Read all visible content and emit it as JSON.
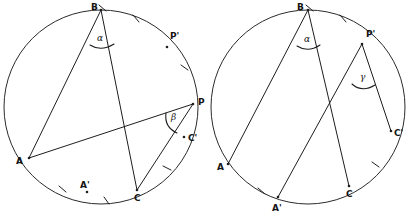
{
  "figure_set": {
    "title": "Inscribed angle circle diagrams",
    "count": 2,
    "stroke_color": "#1e1e1e",
    "background_color": "#ffffff"
  },
  "left_figure": {
    "name": "left-circle-diagram",
    "circle": {
      "cx": 101,
      "cy": 107,
      "r": 97
    },
    "points": [
      {
        "id": "B",
        "label": "B",
        "x": 101,
        "y": 10,
        "label_x": 91,
        "label_y": 10
      },
      {
        "id": "P1",
        "label": "P'",
        "x": 167,
        "y": 47,
        "label_x": 172,
        "label_y": 38
      },
      {
        "id": "P",
        "label": "P",
        "x": 193,
        "y": 104,
        "label_x": 198,
        "label_y": 104
      },
      {
        "id": "C1",
        "label": "C'",
        "x": 184,
        "y": 137,
        "label_x": 187,
        "label_y": 139
      },
      {
        "id": "C",
        "label": "C",
        "x": 137,
        "y": 190,
        "label_x": 136,
        "label_y": 199
      },
      {
        "id": "A1",
        "label": "A'",
        "x": 87,
        "y": 192,
        "label_x": 85,
        "label_y": 186
      },
      {
        "id": "A",
        "label": "A",
        "x": 29,
        "y": 158,
        "label_x": 18,
        "label_y": 162
      }
    ],
    "chords": [
      {
        "from": "B",
        "to": "A"
      },
      {
        "from": "B",
        "to": "C"
      },
      {
        "from": "A",
        "to": "P"
      },
      {
        "from": "C",
        "to": "P"
      }
    ],
    "angles": [
      {
        "id": "alpha",
        "label": "α",
        "vertex": "B",
        "label_x": 98,
        "label_y": 38
      },
      {
        "id": "beta",
        "label": "β",
        "vertex": "P",
        "label_x": 172,
        "label_y": 122
      }
    ],
    "arc_ticks": [
      {
        "on_arc": "B-P'",
        "count": 1
      },
      {
        "on_arc": "P'-P",
        "count": 1
      },
      {
        "on_arc": "C-C'",
        "count": 1
      },
      {
        "on_arc": "A-A'",
        "count": 1
      },
      {
        "on_arc": "A'-C",
        "count": 1
      }
    ]
  },
  "right_figure": {
    "name": "right-circle-diagram",
    "circle": {
      "cx": 308,
      "cy": 107,
      "r": 97
    },
    "points": [
      {
        "id": "B",
        "label": "B",
        "x": 308,
        "y": 10,
        "label_x": 298,
        "label_y": 10
      },
      {
        "id": "P1",
        "label": "P'",
        "x": 362,
        "y": 44,
        "label_x": 368,
        "label_y": 36
      },
      {
        "id": "C1",
        "label": "C'",
        "x": 391,
        "y": 131,
        "label_x": 394,
        "label_y": 133
      },
      {
        "id": "C",
        "label": "C",
        "x": 349,
        "y": 186,
        "label_x": 349,
        "label_y": 196
      },
      {
        "id": "A1",
        "label": "A'",
        "x": 278,
        "y": 197,
        "label_x": 276,
        "label_y": 208
      },
      {
        "id": "A",
        "label": "A",
        "x": 228,
        "y": 164,
        "label_x": 219,
        "label_y": 167
      }
    ],
    "chords": [
      {
        "from": "B",
        "to": "A"
      },
      {
        "from": "B",
        "to": "C"
      },
      {
        "from": "P'",
        "to": "A'"
      },
      {
        "from": "P'",
        "to": "C'"
      }
    ],
    "angles": [
      {
        "id": "alpha",
        "label": "α",
        "vertex": "B",
        "label_x": 305,
        "label_y": 40
      },
      {
        "id": "gamma",
        "label": "γ",
        "vertex": "P'",
        "label_x": 362,
        "label_y": 77
      }
    ],
    "arc_ticks": [
      {
        "on_arc": "B-P'",
        "count": 1
      },
      {
        "on_arc": "C-C'",
        "count": 1
      },
      {
        "on_arc": "A-A'",
        "count": 1
      }
    ]
  }
}
